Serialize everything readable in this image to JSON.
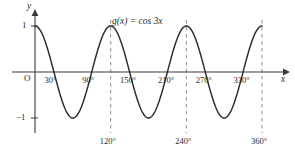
{
  "figure": {
    "kind": "function-graph",
    "curve_label": "g(x) = cos 3x",
    "axis_x_name": "x",
    "axis_y_name": "y",
    "origin_label": "O",
    "y_tick_top_label": "1",
    "y_tick_bottom_label": "−1",
    "axis_tick_labels_on_axis": [
      "30°",
      "90°",
      "150°",
      "210°",
      "270°",
      "330°"
    ],
    "dashed_tick_labels_below": [
      "120°",
      "240°",
      "360°"
    ],
    "colors": {
      "curve": "#2b2b2b",
      "axis": "#3a3a3a",
      "dashed": "#808080",
      "text": "#2a2a2a",
      "background": "#ffffff"
    }
  },
  "chart_data": {
    "type": "line",
    "title": "",
    "subtitle": "",
    "xlabel": "x",
    "ylabel": "y",
    "annotations": [
      "g(x) = cos 3x"
    ],
    "legend": [],
    "legend_position": "none",
    "grid": false,
    "xlim": [
      0,
      380
    ],
    "ylim": [
      -1.35,
      1.35
    ],
    "x_unit": "degrees",
    "function": "cos(3x)",
    "amplitude": 1,
    "period_degrees": 120,
    "x_axis_tick_labels": [
      "30°",
      "90°",
      "150°",
      "210°",
      "270°",
      "330°"
    ],
    "x_axis_tick_values": [
      30,
      90,
      150,
      210,
      270,
      330
    ],
    "dashed_gridline_values": [
      120,
      240,
      360
    ],
    "dashed_gridline_labels": [
      "120°",
      "240°",
      "360°"
    ],
    "y_axis_tick_values": [
      1,
      -1
    ],
    "y_axis_tick_labels": [
      "1",
      "−1"
    ],
    "x_domain_drawn": [
      0,
      360
    ],
    "key_points": {
      "maxima_x": [
        0,
        120,
        240,
        360
      ],
      "minima_x": [
        60,
        180,
        300
      ],
      "zeros_x": [
        30,
        90,
        150,
        210,
        270,
        330
      ]
    },
    "series": [
      {
        "name": "g(x) = cos 3x",
        "x": [
          0,
          10,
          20,
          30,
          40,
          50,
          60,
          70,
          80,
          90,
          100,
          110,
          120,
          130,
          140,
          150,
          160,
          170,
          180,
          190,
          200,
          210,
          220,
          230,
          240,
          250,
          260,
          270,
          280,
          290,
          300,
          310,
          320,
          330,
          340,
          350,
          360
        ],
        "values": [
          1,
          0.866,
          0.5,
          0,
          -0.5,
          -0.866,
          -1,
          -0.866,
          -0.5,
          0,
          0.5,
          0.866,
          1,
          0.866,
          0.5,
          0,
          -0.5,
          -0.866,
          -1,
          -0.866,
          -0.5,
          0,
          0.5,
          0.866,
          1,
          0.866,
          0.5,
          0,
          -0.5,
          -0.866,
          -1,
          -0.866,
          -0.5,
          0,
          0.5,
          0.866,
          1
        ]
      }
    ]
  }
}
